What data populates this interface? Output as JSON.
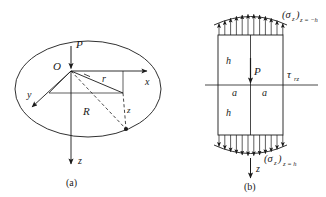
{
  "figure": {
    "title": "",
    "panels": [
      {
        "id": "a",
        "caption": "(a)",
        "description": "semi-infinite elastic half-space with point load P at origin O, cylindrical and cartesian coordinates",
        "labels": {
          "load": "P",
          "origin": "O",
          "axis_x": "x",
          "axis_y": "y",
          "axis_z": "z",
          "radial": "r",
          "distance": "R",
          "depth": "z"
        }
      },
      {
        "id": "b",
        "caption": "(b)",
        "description": "rectangular block of half-height h and half-width a loaded by P, with distributed normal stresses on top and bottom faces and shear stress tau_rz",
        "labels": {
          "load": "P",
          "half_height_upper": "h",
          "half_height_lower": "h",
          "half_width_left": "a",
          "half_width_right": "a",
          "shear_stress": "τ",
          "shear_stress_sub": "rz",
          "axis_z": "z",
          "stress_top": "(σ",
          "stress_top_var": "z",
          "stress_top_close": ")",
          "stress_top_sub": "z = −h",
          "stress_bottom": "(σ",
          "stress_bottom_var": "z",
          "stress_bottom_close": ")",
          "stress_bottom_sub": "z = h"
        }
      }
    ],
    "colors": {
      "stroke": "#1a1a1a",
      "background": "#ffffff"
    }
  }
}
